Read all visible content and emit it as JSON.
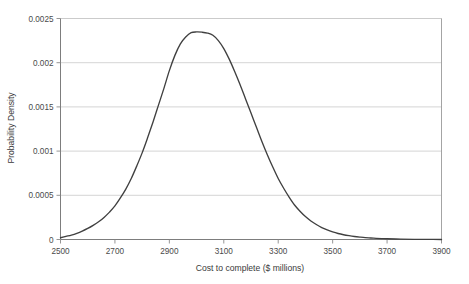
{
  "chart_data": {
    "type": "line",
    "title": "",
    "subtitle": "",
    "xlabel": "Cost to complete ($ millions)",
    "ylabel": "Probability Density",
    "xlim": [
      2500,
      3900
    ],
    "ylim": [
      0,
      0.0025
    ],
    "grid": "horizontal",
    "legend": "none",
    "xticks": [
      2500,
      2700,
      2900,
      3100,
      3300,
      3500,
      3700,
      3900
    ],
    "xtick_labels": [
      "2500",
      "2700",
      "2900",
      "3100",
      "3300",
      "3500",
      "3700",
      "3900"
    ],
    "yticks": [
      0,
      0.0005,
      0.001,
      0.0015,
      0.002,
      0.0025
    ],
    "ytick_labels": [
      "0",
      "0.0005",
      "0.001",
      "0.0015",
      "0.002",
      "0.0025"
    ],
    "series": [
      {
        "name": "Probability Density",
        "color": "#404040",
        "x": [
          2500,
          2520,
          2540,
          2560,
          2580,
          2600,
          2620,
          2640,
          2660,
          2680,
          2700,
          2720,
          2740,
          2760,
          2780,
          2800,
          2820,
          2840,
          2860,
          2880,
          2900,
          2920,
          2940,
          2960,
          2980,
          3000,
          3020,
          3040,
          3060,
          3080,
          3100,
          3120,
          3140,
          3160,
          3180,
          3200,
          3220,
          3240,
          3260,
          3280,
          3300,
          3320,
          3340,
          3360,
          3380,
          3400,
          3420,
          3440,
          3460,
          3480,
          3500,
          3520,
          3540,
          3560,
          3580,
          3600,
          3620,
          3640,
          3660,
          3680,
          3700,
          3750,
          3800,
          3850,
          3900
        ],
        "y": [
          2e-05,
          3.5e-05,
          5e-05,
          7e-05,
          9.5e-05,
          0.000125,
          0.00016,
          0.0002,
          0.00025,
          0.00031,
          0.00038,
          0.00047,
          0.00057,
          0.00069,
          0.00083,
          0.00098,
          0.00115,
          0.00133,
          0.00152,
          0.00171,
          0.00191,
          0.00208,
          0.00221,
          0.00229,
          0.00234,
          0.002348,
          0.002345,
          0.002335,
          0.00231,
          0.00225,
          0.00216,
          0.00204,
          0.0019,
          0.00175,
          0.00159,
          0.00143,
          0.00127,
          0.00111,
          0.00096,
          0.00082,
          0.00069,
          0.00058,
          0.00048,
          0.00039,
          0.00032,
          0.00026,
          0.00021,
          0.00017,
          0.000135,
          0.000108,
          8.6e-05,
          6.8e-05,
          5.4e-05,
          4.3e-05,
          3.4e-05,
          2.7e-05,
          2.1e-05,
          1.7e-05,
          1.3e-05,
          1e-05,
          8e-06,
          4e-06,
          2e-06,
          1e-06,
          5e-07
        ],
        "peak_x": 3000,
        "peak_y": 0.00235
      }
    ]
  },
  "axes": {
    "x_title": "Cost to complete ($ millions)",
    "y_title": "Probability Density"
  }
}
